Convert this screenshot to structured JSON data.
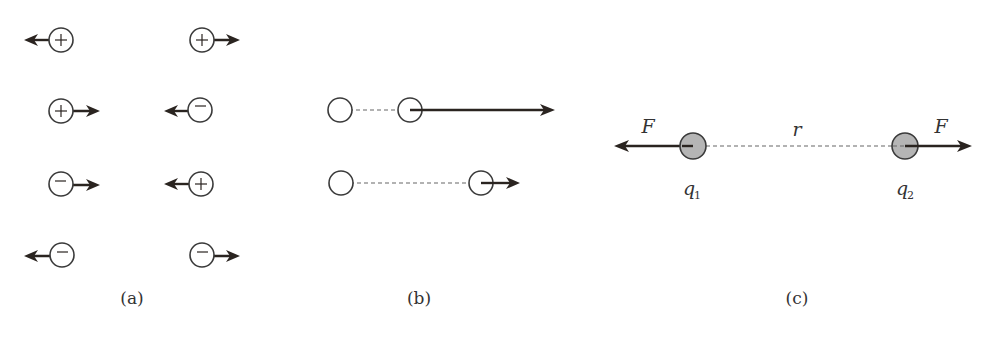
{
  "figure": {
    "colors": {
      "stroke": "#3a3a3a",
      "arrow": "#2a2420",
      "filled_charge": "#b5b5b5",
      "dashed": "#666666",
      "background": "#ffffff"
    },
    "panel_a": {
      "caption": "(a)",
      "pairs": [
        {
          "left": {
            "sign": "+",
            "arrow": "left"
          },
          "right": {
            "sign": "+",
            "arrow": "right"
          }
        },
        {
          "left": {
            "sign": "+",
            "arrow": "right"
          },
          "right": {
            "sign": "-",
            "arrow": "left"
          }
        },
        {
          "left": {
            "sign": "-",
            "arrow": "right"
          },
          "right": {
            "sign": "+",
            "arrow": "left"
          }
        },
        {
          "left": {
            "sign": "-",
            "arrow": "left"
          },
          "right": {
            "sign": "-",
            "arrow": "right"
          }
        }
      ]
    },
    "panel_b": {
      "caption": "(b)",
      "rows": [
        {
          "separation": "short",
          "force_arrow": "long"
        },
        {
          "separation": "long",
          "force_arrow": "short"
        }
      ]
    },
    "panel_c": {
      "caption": "(c)",
      "force_label_left": "F",
      "force_label_right": "F",
      "distance_label": "r",
      "charge1_label": "q",
      "charge1_sub": "1",
      "charge2_label": "q",
      "charge2_sub": "2"
    }
  }
}
